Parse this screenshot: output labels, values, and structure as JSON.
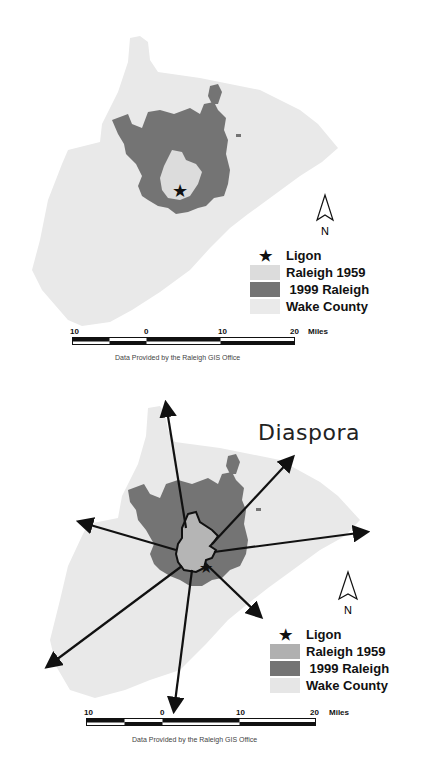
{
  "colors": {
    "wake_county": "#e9e9e9",
    "raleigh_1959_top": "#dcdcdc",
    "raleigh_1959_bottom": "#b5b5b5",
    "raleigh_1999": "#747474",
    "arrows": "#111111"
  },
  "maps": [
    {
      "id": "top",
      "legend": {
        "items": [
          {
            "symbol": "star-icon",
            "label": "Ligon"
          },
          {
            "symbol": "swatch",
            "label": "Raleigh 1959"
          },
          {
            "symbol": "swatch",
            "label": " 1999 Raleigh"
          },
          {
            "symbol": "swatch",
            "label": "Wake County"
          }
        ]
      },
      "north_label": "N",
      "scale": {
        "ticks": [
          "10",
          "0",
          "10",
          "20"
        ],
        "unit": "Miles"
      },
      "credit": "Data Provided by the Raleigh GIS Office"
    },
    {
      "id": "bottom",
      "title": "Diaspora",
      "legend": {
        "items": [
          {
            "symbol": "star-icon",
            "label": "Ligon"
          },
          {
            "symbol": "swatch",
            "label": "Raleigh 1959"
          },
          {
            "symbol": "swatch",
            "label": " 1999 Raleigh"
          },
          {
            "symbol": "swatch",
            "label": "Wake County"
          }
        ]
      },
      "north_label": "N",
      "scale": {
        "ticks": [
          "10",
          "0",
          "10",
          "20"
        ],
        "unit": "Miles"
      },
      "credit": "Data Provided by the Raleigh GIS Office"
    }
  ]
}
